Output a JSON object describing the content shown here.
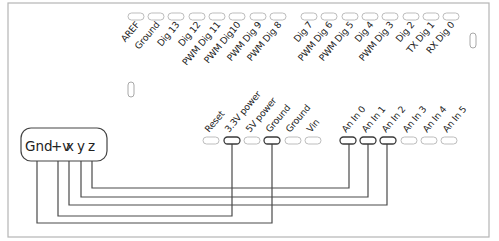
{
  "diagram": {
    "board": {
      "top_header": {
        "group1": [
          "AREF",
          "Ground",
          "Dig 13",
          "Dig 12",
          "PWM Dig 11",
          "PWM Dig10",
          "PWM Dig 9",
          "PWM Dig 8"
        ],
        "group2": [
          "Dig 7",
          "PWM Dig 6",
          "PWM Dig 5",
          "Dig 4",
          "PWM Dig 3",
          "Dig 2",
          "TX Dig 1",
          "RX Dig 0"
        ]
      },
      "bottom_header": {
        "power": [
          "Reset",
          "3.3V power",
          "5V power",
          "Ground",
          "Ground",
          "Vin"
        ],
        "analog": [
          "An In 0",
          "An In 1",
          "An In 2",
          "An In 3",
          "An In 4",
          "An In 5"
        ]
      }
    },
    "sensor": {
      "pins": [
        "Gnd",
        "+v",
        "x",
        "y",
        "z"
      ]
    },
    "connections": [
      {
        "from": "z",
        "to": "An In 0"
      },
      {
        "from": "y",
        "to": "An In 1"
      },
      {
        "from": "x",
        "to": "An In 2"
      },
      {
        "from": "+v",
        "to": "3.3V power"
      },
      {
        "from": "Gnd",
        "to": "Ground"
      }
    ],
    "colors": {
      "line": "#4a4a4a",
      "board_outline": "#b5b5b5",
      "text": "#222222"
    }
  }
}
